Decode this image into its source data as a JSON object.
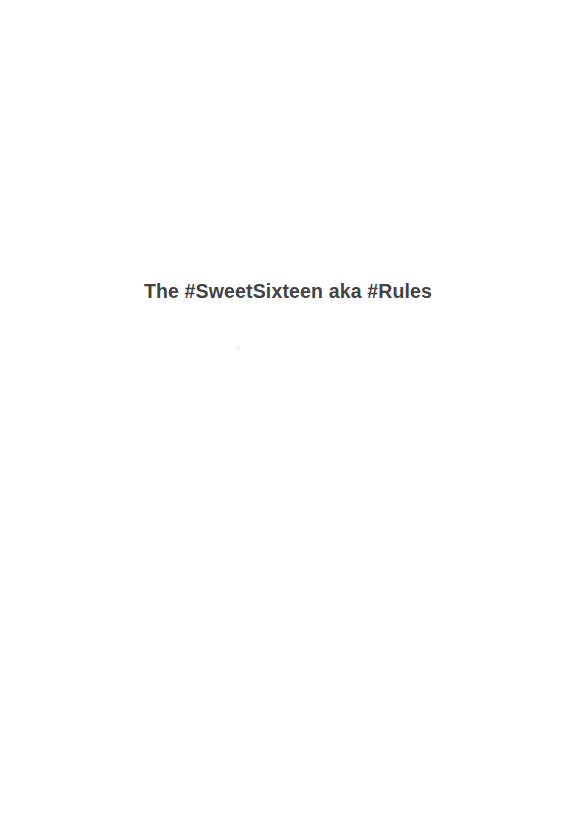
{
  "document": {
    "page_background_color": "#ffffff",
    "page_width": 565,
    "page_height": 832
  },
  "heading": {
    "text": "The #SweetSixteen aka #Rules",
    "color": "#434343",
    "weight": "bold",
    "align": "center"
  },
  "artifacts": {
    "speck_label": "",
    "speck_color": "#f3f3f3"
  },
  "blank_areas": {
    "top_label": "",
    "bottom_label": ""
  }
}
